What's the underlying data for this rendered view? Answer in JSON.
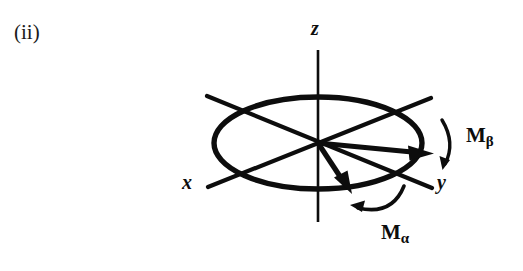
{
  "figure": {
    "label": "(ii)",
    "caption_text": "(ii)"
  },
  "axes": {
    "z": {
      "label": "z",
      "name": "z-axis"
    },
    "x": {
      "label": "x",
      "name": "x-axis"
    },
    "y": {
      "label": "y",
      "name": "y-axis"
    }
  },
  "vectors": [
    {
      "id": "m-beta-vector",
      "label": "M",
      "subscript": "β",
      "description": "magnetization vector pointing along +y",
      "from": [
        318,
        143
      ],
      "to": [
        428,
        152
      ]
    },
    {
      "id": "m-alpha-vector",
      "label": "M",
      "subscript": "α",
      "description": "magnetization vector pointing down-right toward lower ellipse edge",
      "from": [
        318,
        143
      ],
      "to": [
        349,
        190
      ]
    }
  ],
  "labels": {
    "m_beta": {
      "base": "M",
      "subscript": "β"
    },
    "m_alpha": {
      "base": "M",
      "subscript": "α"
    }
  },
  "geometry": {
    "origin": [
      318,
      143
    ],
    "ellipse": {
      "cx": 318,
      "cy": 143,
      "rx": 104,
      "ry": 46
    },
    "z_axis": {
      "x": 318,
      "y_top": 50,
      "y_bottom": 222
    },
    "x_axis": {
      "x1": 208,
      "y1": 187,
      "x2": 430,
      "y2": 99
    },
    "y_axis": {
      "x1": 207,
      "y1": 96,
      "x2": 432,
      "y2": 188
    }
  },
  "colors": {
    "ink": "#0d0d0d",
    "background": "#ffffff"
  },
  "arcs": {
    "beta_rotation": {
      "name": "precession-arc-beta",
      "direction": "clockwise"
    },
    "alpha_rotation": {
      "name": "precession-arc-alpha",
      "direction": "counterclockwise"
    }
  }
}
